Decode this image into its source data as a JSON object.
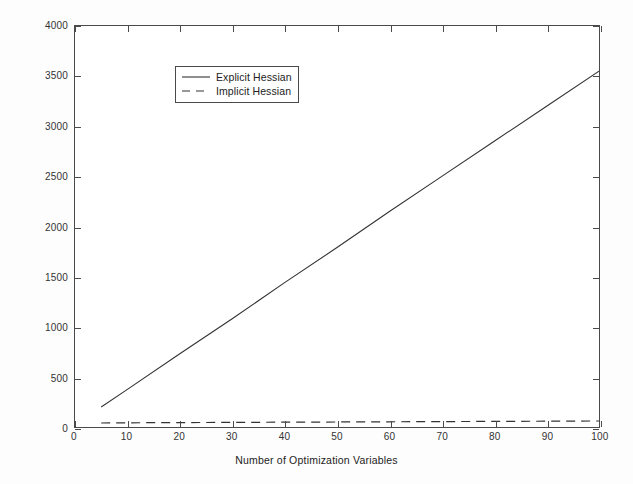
{
  "chart_data": {
    "type": "line",
    "title": "",
    "xlabel": "Number of Optimization Variables",
    "ylabel": "Number of Matrix Vector Products",
    "xlim": [
      0,
      100
    ],
    "ylim": [
      0,
      4000
    ],
    "xticks": [
      0,
      10,
      20,
      30,
      40,
      50,
      60,
      70,
      80,
      90,
      100
    ],
    "yticks": [
      0,
      500,
      1000,
      1500,
      2000,
      2500,
      3000,
      3500,
      4000
    ],
    "xtick_labels": [
      "0",
      "10",
      "20",
      "30",
      "40",
      "50",
      "60",
      "70",
      "80",
      "90",
      "100"
    ],
    "ytick_labels": [
      "0",
      "500",
      "1000",
      "1500",
      "2000",
      "2500",
      "3000",
      "3500",
      "4000"
    ],
    "grid": false,
    "legend_position": "upper left",
    "box": true,
    "series": [
      {
        "name": "Explicit Hessian",
        "style": "solid",
        "color": "#333333",
        "x": [
          5,
          10,
          20,
          30,
          40,
          50,
          60,
          70,
          80,
          90,
          100
        ],
        "values": [
          200,
          375,
          730,
          1080,
          1440,
          1790,
          2150,
          2500,
          2850,
          3200,
          3550
        ]
      },
      {
        "name": "Implicit Hessian",
        "style": "dashed",
        "color": "#333333",
        "x": [
          5,
          10,
          20,
          30,
          40,
          50,
          60,
          70,
          80,
          90,
          100
        ],
        "values": [
          40,
          42,
          44,
          46,
          48,
          50,
          52,
          54,
          56,
          58,
          60
        ]
      }
    ]
  },
  "legend": {
    "entries": [
      {
        "label": "Explicit Hessian",
        "style": "solid"
      },
      {
        "label": "Implicit Hessian",
        "style": "dashed"
      }
    ]
  },
  "colors": {
    "background": "#fdfdfd",
    "plot_background": "#ffffff",
    "axis": "#4a4a4a",
    "line": "#333333"
  }
}
